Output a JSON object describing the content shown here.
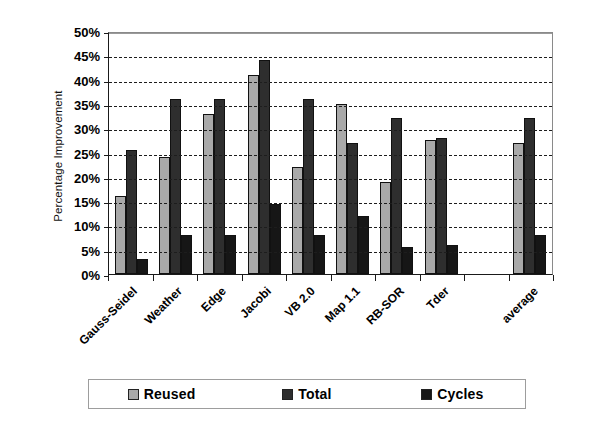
{
  "chart_data": {
    "type": "bar",
    "title": "",
    "xlabel": "",
    "ylabel": "Percentage Improvement",
    "ylim": [
      0,
      50
    ],
    "ytick_labels": [
      "50%",
      "45%",
      "40%",
      "35%",
      "30%",
      "25%",
      "20%",
      "15%",
      "10%",
      "5%",
      "0%"
    ],
    "ytick_values": [
      50,
      45,
      40,
      35,
      30,
      25,
      20,
      15,
      10,
      5,
      0
    ],
    "grid": true,
    "grid_axis": "y",
    "grid_style": "dashed",
    "legend_position": "bottom",
    "categories": [
      "Gauss-Seidel",
      "Weather",
      "Edge",
      "Jacobi",
      "VB 2.0",
      "Map 1.1",
      "RB-SOR",
      "Tder",
      "",
      "average"
    ],
    "series": [
      {
        "name": "Reused",
        "color": "#a9a9a9",
        "values": [
          16,
          24,
          33,
          41,
          22,
          35,
          19,
          27.5,
          null,
          27
        ]
      },
      {
        "name": "Total",
        "color": "#2e2e2e",
        "values": [
          25.5,
          36,
          36,
          44,
          36,
          27,
          32,
          28,
          null,
          32
        ]
      },
      {
        "name": "Cycles",
        "color": "#161616",
        "values": [
          3,
          8,
          8,
          14.5,
          8,
          12,
          5.5,
          6,
          null,
          8
        ]
      }
    ]
  },
  "legend": {
    "entries": [
      {
        "label": "Reused",
        "color": "#a9a9a9"
      },
      {
        "label": "Total",
        "color": "#2e2e2e"
      },
      {
        "label": "Cycles",
        "color": "#161616"
      }
    ]
  }
}
